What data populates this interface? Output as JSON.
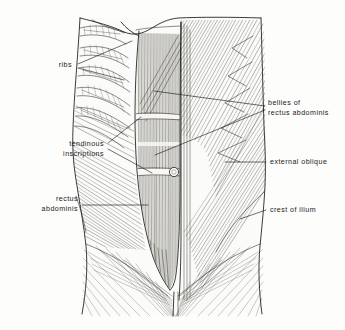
{
  "figure": {
    "kind": "anatomical-illustration",
    "style": "black-and-white pen-and-ink line drawing with hatching",
    "background_color": "#fdfdfc",
    "ink_color": "#191915",
    "label_color": "#1b1b1b"
  },
  "labels": [
    {
      "id": "ribs",
      "text": "ribs",
      "lines": [
        "ribs"
      ],
      "align": "end",
      "x": 72,
      "y": 67,
      "side": "left"
    },
    {
      "id": "tendinous-inscriptions",
      "text": "tendinous inscriptions",
      "lines": [
        "tendinous",
        "inscriptions"
      ],
      "align": "end",
      "x": 104,
      "y": 146,
      "side": "left"
    },
    {
      "id": "rectus-abdominis",
      "text": "rectus abdominis",
      "lines": [
        "rectus",
        "abdominis"
      ],
      "align": "end",
      "x": 78,
      "y": 201,
      "side": "left"
    },
    {
      "id": "bellies-of-rectus-abdominis",
      "text": "bellies of rectus abdominis",
      "lines": [
        "bellies of",
        "rectus abdominis"
      ],
      "align": "start",
      "x": 268,
      "y": 105,
      "side": "right"
    },
    {
      "id": "external-oblique",
      "text": "external oblique",
      "lines": [
        "external oblique"
      ],
      "align": "start",
      "x": 270,
      "y": 164,
      "side": "right"
    },
    {
      "id": "crest-of-ilium",
      "text": "crest of ilium",
      "lines": [
        "crest of ilium"
      ],
      "align": "start",
      "x": 270,
      "y": 212,
      "side": "right"
    }
  ],
  "leaders": [
    {
      "id": "leader-ribs-upper",
      "label": "ribs",
      "points": "78,64 132,41"
    },
    {
      "id": "leader-ribs-lower",
      "label": "ribs",
      "points": "78,68 124,80"
    },
    {
      "id": "leader-tendinous-upper",
      "label": "tendinous-inscriptions",
      "points": "108,143 141,117"
    },
    {
      "id": "leader-tendinous-lower",
      "label": "tendinous-inscriptions",
      "points": "108,149 152,173"
    },
    {
      "id": "leader-rectus-abdominis",
      "label": "rectus-abdominis",
      "points": "82,205 148,205"
    },
    {
      "id": "leader-bellies-upper",
      "label": "bellies-of-rectus-abdominis",
      "points": "265,106 154,91"
    },
    {
      "id": "leader-bellies-lower",
      "label": "bellies-of-rectus-abdominis",
      "points": "265,110 155,155"
    },
    {
      "id": "leader-external-oblique",
      "label": "external-oblique",
      "points": "266,162 225,162"
    },
    {
      "id": "leader-crest-of-ilium",
      "label": "crest-of-ilium",
      "points": "266,210 240,219"
    }
  ],
  "structures": [
    {
      "id": "torso-outline",
      "name": "torso silhouette",
      "path": "M 80,18 C 78,55 74,96 73,128 C 72,152 74,168 77,186 C 80,206 84,226 86,246 C 88,268 86,292 82,314 L 262,314 C 259,292 258,268 260,246 C 262,226 264,206 265,186 C 266,166 265,146 264,126 C 263,94 262,52 261,18 Z"
    },
    {
      "id": "rectus-sheath-left-border",
      "name": "linea semilunaris (left border of rectus)",
      "path": "M 136,30 C 133,70 132,110 133,150 C 134,186 138,220 146,250 C 152,268 160,280 168,288"
    },
    {
      "id": "rectus-sheath-right-border",
      "name": "linea alba / right border of rectus",
      "path": "M 181,22 C 180,70 180,120 180,170 C 180,214 180,256 179,292"
    },
    {
      "id": "rectus-belly",
      "name": "rectus abdominis muscle belly",
      "path": "M 139,33 C 136,76 135,118 137,158 C 139,196 145,232 154,258 C 160,274 166,284 170,289 C 174,282 177,268 178,246 C 180,198 180,110 180,34 Z"
    },
    {
      "id": "umbilicus",
      "name": "umbilicus (navel)",
      "cx": 174,
      "cy": 172,
      "r": 4.6
    },
    {
      "id": "costal-margin",
      "name": "costal margin",
      "path": "M 121,22 C 126,28 132,33 139,36"
    },
    {
      "id": "iliac-crest-line",
      "name": "crest of ilium contour",
      "path": "M 262,196 C 252,204 241,214 232,226 C 224,236 218,246 214,254"
    },
    {
      "id": "inguinal-ligament-left",
      "name": "left inguinal ligament",
      "path": "M 86,244 C 106,252 128,264 148,280 C 156,286 163,292 168,296"
    },
    {
      "id": "inguinal-ligament-right",
      "name": "right inguinal ligament",
      "path": "M 260,244 C 240,252 218,264 198,280 C 190,286 183,292 178,296"
    },
    {
      "id": "pubic-symphysis",
      "name": "pubic symphysis",
      "x": 174,
      "y": 296
    }
  ],
  "ribs": {
    "count": 6,
    "name": "rib arcs with intercostal hatching",
    "arcs": [
      "M 80,28 C 96,24 112,26 124,33",
      "M 80,48 C 98,44 114,48 128,58",
      "M 79,68 C 97,64 114,70 129,82",
      "M 77,88 C 95,85 112,92 130,106",
      "M 76,108 C 93,106 110,114 130,128",
      "M 75,126 C 90,126 106,134 124,148"
    ]
  },
  "muscle_regions": [
    {
      "id": "external-oblique-right",
      "name": "external oblique (right side of figure)",
      "hatch_direction": "diagonal down-left",
      "tone": "medium"
    },
    {
      "id": "external-oblique-left",
      "name": "external oblique (left side of figure)",
      "hatch_direction": "diagonal down-right",
      "tone": "light"
    },
    {
      "id": "serratus-digitations",
      "name": "serrated digitations of external oblique",
      "tone": "medium"
    },
    {
      "id": "rectus-striations",
      "name": "vertical muscle fiber striations of rectus abdominis",
      "tone": "dark"
    },
    {
      "id": "tendinous-inscription-bands",
      "name": "transverse tendinous inscription bands",
      "positions_y": [
        117,
        145,
        173
      ]
    },
    {
      "id": "inguinal-fan",
      "name": "aponeurotic fibers fanning to pubic region",
      "tone": "light"
    }
  ]
}
